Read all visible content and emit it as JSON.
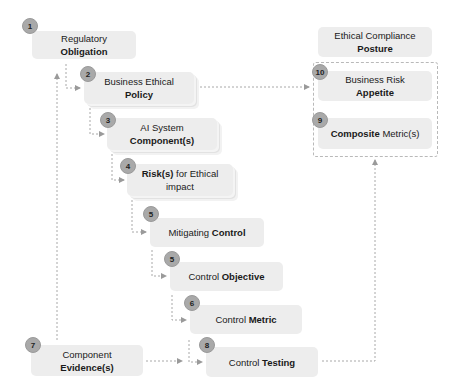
{
  "diagram": {
    "nodes": [
      {
        "id": "regulatory-obligation",
        "badge": "1",
        "text_plain": "Regulatory ",
        "text_bold": "Obligation"
      },
      {
        "id": "business-ethical-policy",
        "badge": "2",
        "line1": "Business Ethical",
        "line2_bold": "Policy"
      },
      {
        "id": "ai-system-components",
        "badge": "3",
        "line1": "AI System",
        "line2_bold": "Component(s)"
      },
      {
        "id": "risks-ethical-impact",
        "badge": "4",
        "line1_bold": "Risk(s)",
        "line1_plain": " for Ethical",
        "line2": "impact"
      },
      {
        "id": "mitigating-control",
        "badge": "5",
        "text_plain": "Mitigating ",
        "text_bold": "Control"
      },
      {
        "id": "control-objective",
        "badge": "5",
        "text_plain": "Control ",
        "text_bold": "Objective"
      },
      {
        "id": "control-metric",
        "badge": "6",
        "text_plain": "Control ",
        "text_bold": "Metric"
      },
      {
        "id": "component-evidences",
        "badge": "7",
        "text_plain": "Component ",
        "text_bold": "Evidence(s)"
      },
      {
        "id": "control-testing",
        "badge": "8",
        "text_plain": "Control ",
        "text_bold": "Testing"
      },
      {
        "id": "composite-metrics",
        "badge": "9",
        "text_bold": "Composite",
        "text_plain": " Metric(s)"
      },
      {
        "id": "business-risk-appetite",
        "badge": "10",
        "line1": "Business Risk",
        "line2_bold": "Appetite"
      },
      {
        "id": "ethical-compliance-posture",
        "badge": "",
        "line1": "Ethical Compliance",
        "line2_bold": "Posture"
      }
    ],
    "colors": {
      "box": "#ededed",
      "badge": "#a9a9a9",
      "connector": "#a0a0a0"
    }
  }
}
